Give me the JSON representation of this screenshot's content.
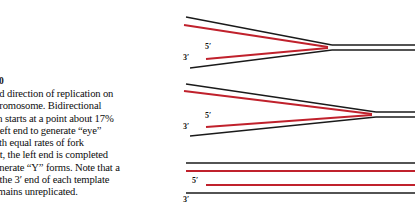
{
  "figure": {
    "caption_number": "17-20",
    "caption_lines": [
      "n and direction of replication on",
      "7 chromosome. Bidirectional",
      "ation starts at a point about 17%",
      "the left end to generate “eye”",
      ". With equal rates of fork",
      "ment, the left end is completed",
      "o generate “Y” forms. Note that a",
      "n at the 3′ end of each template",
      "d remains unreplicated."
    ]
  },
  "colors": {
    "template_strand": "#1a1a1a",
    "nascent_strand": "#c0212c",
    "background": "#ffffff",
    "text": "#111111"
  },
  "diagram": {
    "panels": [
      {
        "name": "eye-form-early",
        "label_five_prime": "5′",
        "label_three_prime": "3′",
        "form": "eye"
      },
      {
        "name": "eye-form-later",
        "label_five_prime": "5′",
        "label_three_prime": "3′",
        "form": "eye"
      },
      {
        "name": "y-form-completed",
        "label_five_prime": "5′",
        "label_three_prime": "3′",
        "form": "linear-completed"
      }
    ]
  }
}
